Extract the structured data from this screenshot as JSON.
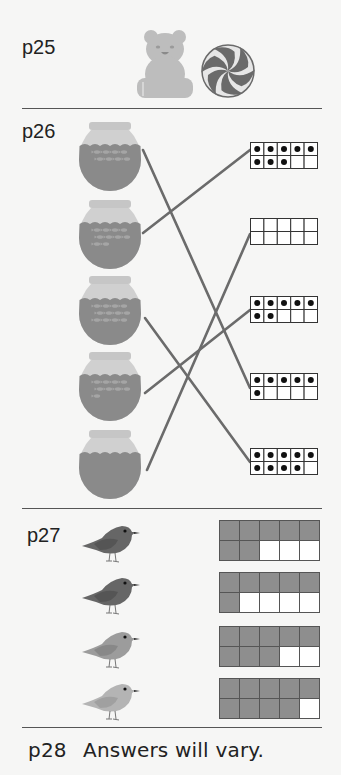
{
  "colors": {
    "background": "#f6f6f5",
    "divider": "#555555",
    "bear": "#bdbdbd",
    "candy_dark": "#6a6a6a",
    "candy_light": "#e6e6e6",
    "bowl_rim": "#c6c6c6",
    "bowl_glass": "#d0d0d0",
    "bowl_water": "#8a8a8a",
    "connector_line": "#6b6b6b",
    "frame_line": "#333333",
    "frame_shaded": "#8e8e8e",
    "dot": "#111111"
  },
  "sections": {
    "p25": {
      "label": "p25",
      "images": [
        {
          "icon": "gummy-bear-icon"
        },
        {
          "icon": "swirl-lollipop-icon"
        }
      ]
    },
    "p26": {
      "label": "p26",
      "bowls": [
        {
          "fish": 8,
          "matches_frame": 3
        },
        {
          "fish": 10,
          "matches_frame": 0
        },
        {
          "fish": 12,
          "matches_frame": 4
        },
        {
          "fish": 9,
          "matches_frame": 2
        },
        {
          "fish": 0,
          "matches_frame": 1
        }
      ],
      "ten_frames": [
        {
          "dots": 8
        },
        {
          "dots": 0
        },
        {
          "dots": 7
        },
        {
          "dots": 6
        },
        {
          "dots": 9
        }
      ]
    },
    "p27": {
      "label": "p27",
      "rows": [
        {
          "bird_shade": "dark",
          "shaded_cells": 7
        },
        {
          "bird_shade": "dark",
          "shaded_cells": 6
        },
        {
          "bird_shade": "light",
          "shaded_cells": 8
        },
        {
          "bird_shade": "lighter",
          "shaded_cells": 9
        }
      ]
    },
    "p28": {
      "label": "p28",
      "text": "Answers will vary."
    }
  }
}
